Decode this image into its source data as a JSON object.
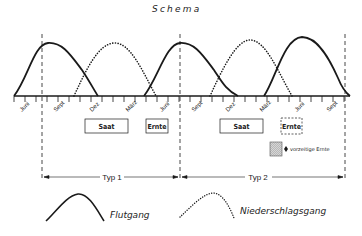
{
  "title": "Schema",
  "axis": {
    "months": [
      {
        "label": "Juni",
        "x": 30
      },
      {
        "label": "Sept",
        "x": 64
      },
      {
        "label": "Dez",
        "x": 97
      },
      {
        "label": "März",
        "x": 130
      },
      {
        "label": "Juni",
        "x": 163
      },
      {
        "label": "Sept",
        "x": 197
      },
      {
        "label": "Dez",
        "x": 230
      },
      {
        "label": "März",
        "x": 263
      },
      {
        "label": "Juni",
        "x": 296
      },
      {
        "label": "Sept",
        "x": 330
      }
    ]
  },
  "boxes": {
    "typ1_saat": "Saat",
    "typ1_ernte": "Ernte",
    "typ2_saat": "Saat",
    "typ2_ernte": "Ernte",
    "early_harvest": "vorzeitige Ernte"
  },
  "periods": {
    "typ1": "Typ 1",
    "typ2": "Typ 2"
  },
  "legend": {
    "solid": "Flutgang",
    "dotted": "Niederschlagsgang"
  },
  "colors": {
    "ink": "#1a1a1a",
    "hatch": "#bdbdbd",
    "background": "#ffffff"
  }
}
